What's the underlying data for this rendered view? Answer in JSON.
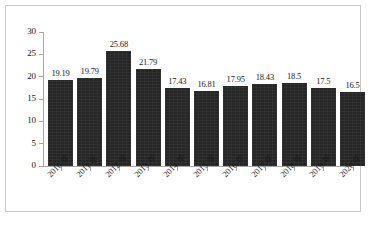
{
  "figure": {
    "background_color": "#ffffff",
    "frame_color": "#c9c9c9",
    "bar_color": "#262626",
    "axis_color": "#a6a6a6",
    "text_color": "#1a1a1a"
  },
  "chart_data": {
    "type": "bar",
    "title": "",
    "subtitle": "",
    "xlabel": "",
    "ylabel": "",
    "categories": [
      "2010 年",
      "2011 年",
      "2012 年",
      "2013 年",
      "2014 年",
      "2015 年",
      "2016 年",
      "2017 年",
      "2018 年",
      "2019 年",
      "2020 年"
    ],
    "values": [
      19.19,
      19.79,
      25.68,
      21.79,
      17.43,
      16.81,
      17.95,
      18.43,
      18.5,
      17.5,
      16.5
    ],
    "value_labels": [
      "19.19",
      "19.79",
      "25.68",
      "21.79",
      "17.43",
      "16.81",
      "17.95",
      "18.43",
      "18.5",
      "17.5",
      "16.5"
    ],
    "ylim": [
      0,
      30
    ],
    "y_ticks": [
      0,
      5,
      10,
      15,
      20,
      25,
      30
    ],
    "y_tick_labels": [
      "0",
      "5",
      "10",
      "15",
      "20",
      "25",
      "30"
    ],
    "grid": false,
    "legend": null,
    "legend_position": "none",
    "series": [
      {
        "name": "",
        "values": [
          19.19,
          19.79,
          25.68,
          21.79,
          17.43,
          16.81,
          17.95,
          18.43,
          18.5,
          17.5,
          16.5
        ]
      }
    ],
    "annotations": [],
    "xtick_rotation": -45,
    "data_labels_shown": true
  }
}
